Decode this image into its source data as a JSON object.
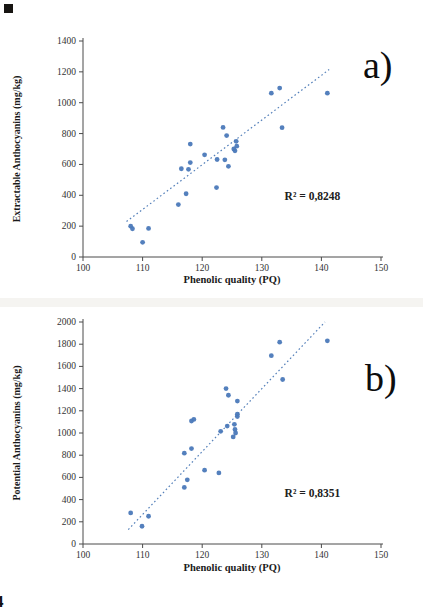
{
  "page": {
    "page_number": "4"
  },
  "chart_data": [
    {
      "id": "panel-a",
      "type": "scatter",
      "panel_label": "a)",
      "xlabel": "Phenolic quality (PQ)",
      "ylabel": "Extractable Anthocyanins (mg/kg)",
      "xlim": [
        100,
        150
      ],
      "ylim": [
        0,
        1400
      ],
      "xticks": [
        100,
        110,
        120,
        130,
        140,
        150
      ],
      "yticks": [
        0,
        200,
        400,
        600,
        800,
        1000,
        1200,
        1400
      ],
      "r2_label": "R² = 0,8248",
      "legend": "none",
      "grid": false,
      "point_color": "#4b79b9",
      "line_color": "#5580ba",
      "points": [
        [
          108,
          200
        ],
        [
          108.3,
          183
        ],
        [
          110,
          95
        ],
        [
          111,
          185
        ],
        [
          116,
          340
        ],
        [
          116.5,
          572
        ],
        [
          117.7,
          568
        ],
        [
          118,
          612
        ],
        [
          118,
          732
        ],
        [
          117.3,
          410
        ],
        [
          120.4,
          662
        ],
        [
          122.5,
          632
        ],
        [
          122.4,
          450
        ],
        [
          123.5,
          840
        ],
        [
          123.8,
          630
        ],
        [
          124.1,
          787
        ],
        [
          124.4,
          588
        ],
        [
          125.3,
          700
        ],
        [
          125.5,
          688
        ],
        [
          125.7,
          750
        ],
        [
          125.8,
          718
        ],
        [
          131.6,
          1062
        ],
        [
          133,
          1095
        ],
        [
          133.4,
          838
        ],
        [
          141,
          1062
        ]
      ],
      "trendline": {
        "style": "dotted",
        "x1": 107.3,
        "y1": 230,
        "x2": 141.3,
        "y2": 1215
      }
    },
    {
      "id": "panel-b",
      "type": "scatter",
      "panel_label": "b)",
      "xlabel": "Phenolic quality (PQ)",
      "ylabel": "Potential Anthocyanins (mg/kg)",
      "xlim": [
        100,
        150
      ],
      "ylim": [
        0,
        2000
      ],
      "xticks": [
        100,
        110,
        120,
        130,
        140,
        150
      ],
      "yticks": [
        0,
        200,
        400,
        600,
        800,
        1000,
        1200,
        1400,
        1600,
        1800,
        2000
      ],
      "r2_label": "R² = 0,8351",
      "legend": "none",
      "grid": false,
      "point_color": "#4b79b9",
      "line_color": "#5580ba",
      "points": [
        [
          108,
          280
        ],
        [
          109.9,
          160
        ],
        [
          111,
          250
        ],
        [
          117,
          510
        ],
        [
          117.5,
          578
        ],
        [
          117,
          818
        ],
        [
          118.2,
          860
        ],
        [
          118.2,
          1108
        ],
        [
          118.6,
          1122
        ],
        [
          120.4,
          665
        ],
        [
          122.8,
          640
        ],
        [
          123.1,
          1015
        ],
        [
          124.2,
          1062
        ],
        [
          125.4,
          1078
        ],
        [
          125.5,
          1032
        ],
        [
          125.6,
          1000
        ],
        [
          125.2,
          965
        ],
        [
          125.9,
          1170
        ],
        [
          125.9,
          1148
        ],
        [
          125.9,
          1288
        ],
        [
          124.4,
          1340
        ],
        [
          124,
          1400
        ],
        [
          131.6,
          1697
        ],
        [
          133,
          1818
        ],
        [
          133.5,
          1482
        ],
        [
          141,
          1830
        ]
      ],
      "trendline": {
        "style": "dotted",
        "x1": 107.6,
        "y1": 130,
        "x2": 140.6,
        "y2": 2000
      }
    }
  ]
}
